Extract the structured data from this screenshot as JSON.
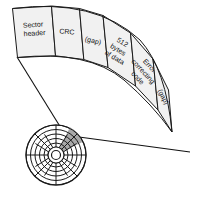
{
  "diagram": {
    "band": {
      "name": "sector-band",
      "segments": [
        {
          "id": "sector-header",
          "label_lines": [
            "Sector",
            "header"
          ],
          "fill": "#f1f1f1"
        },
        {
          "id": "crc",
          "label_lines": [
            "CRC"
          ],
          "fill": "#f1f1f1"
        },
        {
          "id": "gap-1",
          "label_lines": [
            "(gap)"
          ],
          "fill": "#f1f1f1"
        },
        {
          "id": "data",
          "label_lines": [
            "512",
            "bytes",
            "of data"
          ],
          "fill": "#f1f1f1"
        },
        {
          "id": "ecc",
          "label_lines": [
            "Error",
            "correcting",
            "code"
          ],
          "fill": "#f1f1f1"
        },
        {
          "id": "gap-2",
          "label_lines": [
            "(gap)"
          ],
          "fill": "#f1f1f1"
        }
      ]
    },
    "platter": {
      "name": "disk-platter",
      "track_count": 6,
      "sector_count": 16,
      "highlight_color": "#a9a9a9",
      "outline_color": "#1a1a1a",
      "background_color": "#ffffff"
    },
    "callouts": [
      {
        "id": "callout-left"
      },
      {
        "id": "callout-right"
      }
    ]
  },
  "labels": {
    "seg_0_line_0": "Sector",
    "seg_0_line_1": "header",
    "seg_1_line_0": "CRC",
    "seg_2_line_0": "(gap)",
    "seg_3_line_0": "512",
    "seg_3_line_1": "bytes",
    "seg_3_line_2": "of data",
    "seg_4_line_0": "Error",
    "seg_4_line_1": "correcting",
    "seg_4_line_2": "code",
    "seg_5_line_0": "(gap)"
  }
}
